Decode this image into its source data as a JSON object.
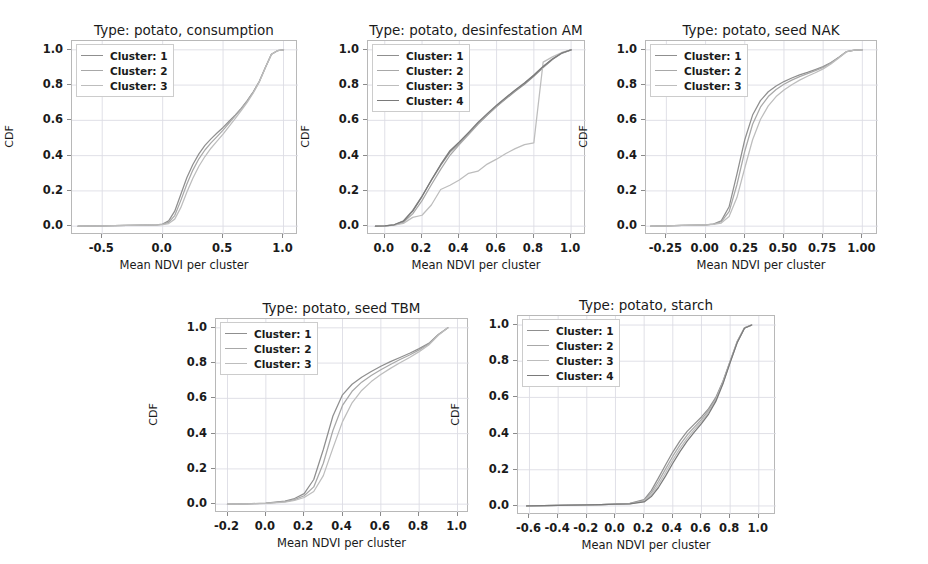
{
  "figure": {
    "background": "#ffffff",
    "n_panels": 5,
    "shared_xlabel": "Mean NDVI per cluster",
    "shared_ylabel": "CDF"
  },
  "chart_data": [
    {
      "type": "line",
      "title": "Type: potato, consumption",
      "xlabel": "Mean NDVI per cluster",
      "ylabel": "CDF",
      "xlim": [
        -0.75,
        1.12
      ],
      "ylim": [
        -0.05,
        1.05
      ],
      "xticks": [
        "-0.5",
        "0.0",
        "0.5",
        "1.0"
      ],
      "xtick_values": [
        -0.5,
        0.0,
        0.5,
        1.0
      ],
      "yticks": [
        "0.0",
        "0.2",
        "0.4",
        "0.6",
        "0.8",
        "1.0"
      ],
      "ytick_values": [
        0.0,
        0.2,
        0.4,
        0.6,
        0.8,
        1.0
      ],
      "grid": true,
      "legend_position": "upper left",
      "legend": [
        "Cluster: 1",
        "Cluster: 2",
        "Cluster: 3"
      ],
      "colors": [
        "#8f8f8f",
        "#a8a8a8",
        "#bdbdbd"
      ],
      "x": [
        -0.7,
        -0.5,
        -0.3,
        -0.15,
        -0.05,
        0.0,
        0.05,
        0.1,
        0.15,
        0.2,
        0.25,
        0.3,
        0.35,
        0.4,
        0.45,
        0.5,
        0.55,
        0.6,
        0.65,
        0.7,
        0.75,
        0.8,
        0.85,
        0.9,
        0.95,
        1.0
      ],
      "series": [
        {
          "name": "Cluster: 1",
          "values": [
            0.0,
            0.002,
            0.004,
            0.006,
            0.008,
            0.012,
            0.03,
            0.085,
            0.18,
            0.275,
            0.35,
            0.41,
            0.458,
            0.495,
            0.528,
            0.56,
            0.595,
            0.63,
            0.668,
            0.712,
            0.762,
            0.82,
            0.9,
            0.975,
            0.995,
            1.0
          ]
        },
        {
          "name": "Cluster: 2",
          "values": [
            0.0,
            0.002,
            0.004,
            0.006,
            0.008,
            0.01,
            0.022,
            0.06,
            0.145,
            0.238,
            0.318,
            0.382,
            0.432,
            0.472,
            0.508,
            0.545,
            0.585,
            0.625,
            0.665,
            0.71,
            0.76,
            0.822,
            0.9,
            0.975,
            0.995,
            1.0
          ]
        },
        {
          "name": "Cluster: 3",
          "values": [
            0.0,
            0.002,
            0.004,
            0.006,
            0.008,
            0.009,
            0.015,
            0.04,
            0.105,
            0.192,
            0.272,
            0.34,
            0.395,
            0.442,
            0.482,
            0.522,
            0.566,
            0.61,
            0.655,
            0.702,
            0.755,
            0.818,
            0.898,
            0.974,
            0.995,
            1.0
          ]
        }
      ]
    },
    {
      "type": "line",
      "title": "Type: potato, desinfestation AM",
      "xlabel": "Mean NDVI per cluster",
      "ylabel": "CDF",
      "xlim": [
        -0.09,
        1.08
      ],
      "ylim": [
        -0.05,
        1.05
      ],
      "xticks": [
        "0.0",
        "0.2",
        "0.4",
        "0.6",
        "0.8",
        "1.0"
      ],
      "xtick_values": [
        0.0,
        0.2,
        0.4,
        0.6,
        0.8,
        1.0
      ],
      "yticks": [
        "0.0",
        "0.2",
        "0.4",
        "0.6",
        "0.8",
        "1.0"
      ],
      "ytick_values": [
        0.0,
        0.2,
        0.4,
        0.6,
        0.8,
        1.0
      ],
      "grid": true,
      "legend_position": "upper left",
      "legend": [
        "Cluster: 1",
        "Cluster: 2",
        "Cluster: 3",
        "Cluster: 4"
      ],
      "colors": [
        "#8f8f8f",
        "#a8a8a8",
        "#bdbdbd",
        "#7a7a7a"
      ],
      "x": [
        -0.05,
        0.0,
        0.05,
        0.1,
        0.15,
        0.2,
        0.25,
        0.3,
        0.35,
        0.4,
        0.45,
        0.5,
        0.55,
        0.6,
        0.65,
        0.7,
        0.75,
        0.8,
        0.85,
        0.9,
        0.95,
        1.0
      ],
      "series": [
        {
          "name": "Cluster: 1",
          "values": [
            0.0,
            0.002,
            0.008,
            0.03,
            0.09,
            0.17,
            0.26,
            0.345,
            0.42,
            0.47,
            0.525,
            0.58,
            0.63,
            0.678,
            0.722,
            0.765,
            0.805,
            0.85,
            0.9,
            0.945,
            0.98,
            1.0
          ]
        },
        {
          "name": "Cluster: 2",
          "values": [
            0.0,
            0.002,
            0.006,
            0.022,
            0.07,
            0.145,
            0.235,
            0.322,
            0.402,
            0.462,
            0.52,
            0.578,
            0.63,
            0.68,
            0.726,
            0.77,
            0.812,
            0.858,
            0.905,
            0.948,
            0.982,
            1.0
          ]
        },
        {
          "name": "Cluster: 3",
          "values": [
            0.0,
            0.002,
            0.006,
            0.016,
            0.05,
            0.062,
            0.12,
            0.208,
            0.232,
            0.262,
            0.3,
            0.312,
            0.352,
            0.38,
            0.412,
            0.44,
            0.462,
            0.472,
            0.93,
            0.96,
            0.985,
            1.0
          ]
        },
        {
          "name": "Cluster: 4",
          "values": [
            0.0,
            0.002,
            0.008,
            0.028,
            0.085,
            0.168,
            0.262,
            0.35,
            0.428,
            0.478,
            0.532,
            0.588,
            0.638,
            0.686,
            0.73,
            0.772,
            0.812,
            0.856,
            0.905,
            0.948,
            0.982,
            1.0
          ]
        }
      ]
    },
    {
      "type": "line",
      "title": "Type: potato, seed NAK",
      "xlabel": "Mean NDVI per cluster",
      "ylabel": "CDF",
      "xlim": [
        -0.38,
        1.1
      ],
      "ylim": [
        -0.05,
        1.05
      ],
      "xticks": [
        "-0.25",
        "0.00",
        "0.25",
        "0.50",
        "0.75",
        "1.00"
      ],
      "xtick_values": [
        -0.25,
        0.0,
        0.25,
        0.5,
        0.75,
        1.0
      ],
      "yticks": [
        "0.0",
        "0.2",
        "0.4",
        "0.6",
        "0.8",
        "1.0"
      ],
      "ytick_values": [
        0.0,
        0.2,
        0.4,
        0.6,
        0.8,
        1.0
      ],
      "grid": true,
      "legend_position": "upper left",
      "legend": [
        "Cluster: 1",
        "Cluster: 2",
        "Cluster: 3"
      ],
      "colors": [
        "#8f8f8f",
        "#a8a8a8",
        "#bdbdbd"
      ],
      "x": [
        -0.35,
        -0.25,
        -0.15,
        -0.05,
        0.0,
        0.05,
        0.1,
        0.15,
        0.2,
        0.25,
        0.3,
        0.35,
        0.4,
        0.45,
        0.5,
        0.55,
        0.6,
        0.65,
        0.7,
        0.75,
        0.8,
        0.85,
        0.9,
        0.95,
        1.0
      ],
      "series": [
        {
          "name": "Cluster: 1",
          "values": [
            0.0,
            0.002,
            0.004,
            0.006,
            0.008,
            0.012,
            0.03,
            0.11,
            0.295,
            0.49,
            0.63,
            0.712,
            0.762,
            0.795,
            0.82,
            0.84,
            0.858,
            0.872,
            0.888,
            0.905,
            0.928,
            0.958,
            0.99,
            0.998,
            1.0
          ]
        },
        {
          "name": "Cluster: 2",
          "values": [
            0.0,
            0.002,
            0.004,
            0.006,
            0.008,
            0.011,
            0.025,
            0.082,
            0.235,
            0.425,
            0.578,
            0.675,
            0.735,
            0.775,
            0.805,
            0.828,
            0.848,
            0.865,
            0.882,
            0.9,
            0.925,
            0.956,
            0.99,
            0.998,
            1.0
          ]
        },
        {
          "name": "Cluster: 3",
          "values": [
            0.0,
            0.002,
            0.004,
            0.006,
            0.008,
            0.01,
            0.018,
            0.055,
            0.162,
            0.33,
            0.49,
            0.605,
            0.682,
            0.735,
            0.772,
            0.802,
            0.828,
            0.85,
            0.87,
            0.892,
            0.92,
            0.954,
            0.989,
            0.998,
            1.0
          ]
        }
      ]
    },
    {
      "type": "line",
      "title": "Type: potato, seed TBM",
      "xlabel": "Mean NDVI per cluster",
      "ylabel": "CDF",
      "xlim": [
        -0.26,
        1.06
      ],
      "ylim": [
        -0.05,
        1.05
      ],
      "xticks": [
        "-0.2",
        "0.0",
        "0.2",
        "0.4",
        "0.6",
        "0.8",
        "1.0"
      ],
      "xtick_values": [
        -0.2,
        0.0,
        0.2,
        0.4,
        0.6,
        0.8,
        1.0
      ],
      "yticks": [
        "0.0",
        "0.2",
        "0.4",
        "0.6",
        "0.8",
        "1.0"
      ],
      "ytick_values": [
        0.0,
        0.2,
        0.4,
        0.6,
        0.8,
        1.0
      ],
      "grid": true,
      "legend_position": "upper left",
      "legend": [
        "Cluster: 1",
        "Cluster: 2",
        "Cluster: 3"
      ],
      "colors": [
        "#8f8f8f",
        "#a8a8a8",
        "#bdbdbd"
      ],
      "x": [
        -0.2,
        -0.1,
        0.0,
        0.1,
        0.15,
        0.2,
        0.25,
        0.3,
        0.35,
        0.4,
        0.45,
        0.5,
        0.55,
        0.6,
        0.65,
        0.7,
        0.75,
        0.8,
        0.85,
        0.9,
        0.95
      ],
      "series": [
        {
          "name": "Cluster: 1",
          "values": [
            0.0,
            0.002,
            0.006,
            0.018,
            0.032,
            0.06,
            0.14,
            0.31,
            0.5,
            0.62,
            0.68,
            0.72,
            0.752,
            0.782,
            0.808,
            0.832,
            0.856,
            0.882,
            0.912,
            0.962,
            1.0
          ]
        },
        {
          "name": "Cluster: 2",
          "values": [
            0.0,
            0.002,
            0.005,
            0.014,
            0.026,
            0.048,
            0.098,
            0.232,
            0.418,
            0.56,
            0.64,
            0.692,
            0.73,
            0.762,
            0.792,
            0.82,
            0.846,
            0.875,
            0.908,
            0.96,
            1.0
          ]
        },
        {
          "name": "Cluster: 3",
          "values": [
            0.0,
            0.002,
            0.004,
            0.011,
            0.021,
            0.038,
            0.072,
            0.162,
            0.318,
            0.468,
            0.575,
            0.645,
            0.695,
            0.735,
            0.77,
            0.802,
            0.832,
            0.865,
            0.902,
            0.958,
            1.0
          ]
        }
      ]
    },
    {
      "type": "line",
      "title": "Type: potato, starch",
      "xlabel": "Mean NDVI per cluster",
      "ylabel": "CDF",
      "xlim": [
        -0.68,
        1.12
      ],
      "ylim": [
        -0.05,
        1.05
      ],
      "xticks": [
        "-0.6",
        "-0.4",
        "-0.2",
        "0.0",
        "0.2",
        "0.4",
        "0.6",
        "0.8",
        "1.0"
      ],
      "xtick_values": [
        -0.6,
        -0.4,
        -0.2,
        0.0,
        0.2,
        0.4,
        0.6,
        0.8,
        1.0
      ],
      "yticks": [
        "0.0",
        "0.2",
        "0.4",
        "0.6",
        "0.8",
        "1.0"
      ],
      "ytick_values": [
        0.0,
        0.2,
        0.4,
        0.6,
        0.8,
        1.0
      ],
      "grid": true,
      "legend_position": "upper left",
      "legend": [
        "Cluster: 1",
        "Cluster: 2",
        "Cluster: 3",
        "Cluster: 4"
      ],
      "colors": [
        "#8f8f8f",
        "#a8a8a8",
        "#bdbdbd",
        "#7a7a7a"
      ],
      "x": [
        -0.62,
        -0.5,
        -0.4,
        -0.3,
        -0.2,
        -0.1,
        0.0,
        0.1,
        0.2,
        0.25,
        0.3,
        0.35,
        0.4,
        0.45,
        0.5,
        0.55,
        0.6,
        0.65,
        0.7,
        0.75,
        0.8,
        0.85,
        0.9,
        0.95
      ],
      "series": [
        {
          "name": "Cluster: 1",
          "values": [
            0.0,
            0.002,
            0.003,
            0.004,
            0.006,
            0.008,
            0.01,
            0.014,
            0.035,
            0.085,
            0.155,
            0.228,
            0.298,
            0.36,
            0.412,
            0.452,
            0.492,
            0.538,
            0.6,
            0.69,
            0.8,
            0.91,
            0.985,
            1.0
          ]
        },
        {
          "name": "Cluster: 2",
          "values": [
            0.0,
            0.002,
            0.003,
            0.004,
            0.006,
            0.008,
            0.01,
            0.013,
            0.03,
            0.072,
            0.135,
            0.205,
            0.275,
            0.338,
            0.392,
            0.436,
            0.478,
            0.528,
            0.592,
            0.685,
            0.798,
            0.908,
            0.984,
            1.0
          ]
        },
        {
          "name": "Cluster: 3",
          "values": [
            0.0,
            0.002,
            0.003,
            0.004,
            0.006,
            0.008,
            0.01,
            0.012,
            0.026,
            0.062,
            0.118,
            0.185,
            0.255,
            0.318,
            0.374,
            0.422,
            0.466,
            0.518,
            0.585,
            0.68,
            0.795,
            0.906,
            0.983,
            1.0
          ]
        },
        {
          "name": "Cluster: 4",
          "values": [
            0.0,
            0.002,
            0.003,
            0.004,
            0.006,
            0.008,
            0.01,
            0.012,
            0.022,
            0.052,
            0.102,
            0.166,
            0.236,
            0.3,
            0.358,
            0.408,
            0.455,
            0.508,
            0.578,
            0.675,
            0.792,
            0.904,
            0.982,
            1.0
          ]
        }
      ]
    }
  ],
  "panels": [
    {
      "id": "panel-consumption",
      "left": 71,
      "top": 40,
      "width": 226,
      "height": 194,
      "title_top": 22
    },
    {
      "id": "panel-desinfestation-am",
      "left": 367,
      "top": 40,
      "width": 218,
      "height": 194,
      "title_top": 22
    },
    {
      "id": "panel-seed-nak",
      "left": 645,
      "top": 40,
      "width": 232,
      "height": 194,
      "title_top": 22
    },
    {
      "id": "panel-seed-tbm",
      "left": 215,
      "top": 318,
      "width": 253,
      "height": 194,
      "title_top": 300
    },
    {
      "id": "panel-starch",
      "left": 517,
      "top": 315,
      "width": 258,
      "height": 199,
      "title_top": 297
    }
  ]
}
